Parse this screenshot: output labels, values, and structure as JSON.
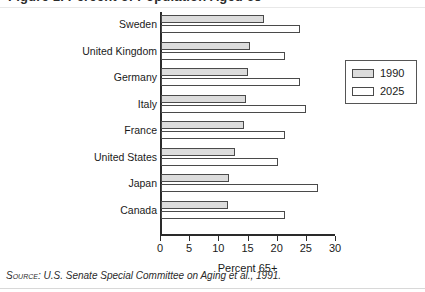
{
  "figure": {
    "title_cropped": "Figure 1. Percent of Population Aged 65+",
    "axis_label": "Percent 65+",
    "source": "U.S. Senate Special Committee on Aging et al., 1991.",
    "source_prefix": "Source:"
  },
  "legend": {
    "position": "upper-right",
    "entries": [
      {
        "label": "1990",
        "fill": "#dcdcdc"
      },
      {
        "label": "2025",
        "fill": "#ffffff"
      }
    ]
  },
  "chart_data": {
    "type": "bar",
    "orientation": "horizontal",
    "title": "Figure 1. Percent of Population Aged 65+",
    "xlabel": "Percent 65+",
    "ylabel": "",
    "xlim": [
      0,
      30
    ],
    "xticks": [
      0,
      5,
      10,
      15,
      20,
      25,
      30
    ],
    "grid": false,
    "legend_position": "upper right",
    "categories": [
      "Sweden",
      "United Kingdom",
      "Germany",
      "Italy",
      "France",
      "United States",
      "Japan",
      "Canada"
    ],
    "series": [
      {
        "name": "1990",
        "color": "#dcdcdc",
        "values": [
          17.7,
          15.3,
          14.9,
          14.5,
          14.2,
          12.6,
          11.7,
          11.4
        ]
      },
      {
        "name": "2025",
        "color": "#ffffff",
        "values": [
          23.8,
          21.2,
          23.9,
          24.9,
          21.2,
          20.0,
          26.9,
          21.2
        ]
      }
    ]
  }
}
